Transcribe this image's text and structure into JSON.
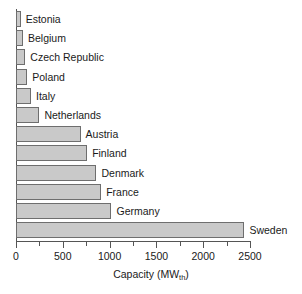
{
  "chart_data": {
    "type": "bar",
    "orientation": "horizontal",
    "title": "",
    "xlabel": "Capacity (MWth)",
    "xlabel_base": "Capacity (MW",
    "xlabel_sub": "th",
    "xlabel_tail": ")",
    "ylabel": "",
    "categories": [
      "Estonia",
      "Belgium",
      "Czech Republic",
      "Poland",
      "Italy",
      "Netherlands",
      "Austria",
      "Finland",
      "Denmark",
      "France",
      "Germany",
      "Sweden"
    ],
    "values": [
      50,
      75,
      100,
      120,
      160,
      250,
      690,
      760,
      860,
      910,
      1020,
      2440
    ],
    "xlim": [
      0,
      2500
    ],
    "xticks": [
      0,
      500,
      1000,
      1500,
      2000,
      2500
    ],
    "xtick_labels": [
      "0",
      "500",
      "1000",
      "1500",
      "2000",
      "2500"
    ],
    "xminor_ticks": [
      250,
      750,
      1250,
      1750,
      2250
    ],
    "grid": false,
    "legend": false,
    "bar_color": "#c9c9c9",
    "bar_edge_color": "#6e6e6e",
    "axis_color": "#555555",
    "background": "#ffffff"
  }
}
